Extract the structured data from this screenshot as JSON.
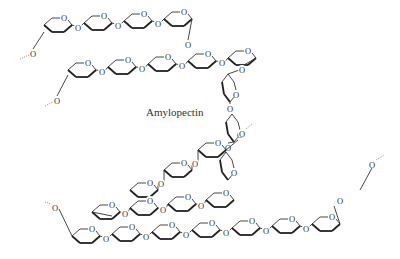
{
  "diagram": {
    "title": "Amylopectin",
    "label_position": {
      "x": 146,
      "y": 106
    },
    "atom_symbol": "O",
    "colors": {
      "background": "#ffffff",
      "bonds": "#333333",
      "text": "#333333"
    },
    "chains": [
      {
        "name": "top-chain",
        "rings": 4
      },
      {
        "name": "second-chain",
        "rings": 5
      },
      {
        "name": "right-descending-chain",
        "rings": 4
      },
      {
        "name": "middle-branch-chain",
        "rings": 3
      },
      {
        "name": "lower-left-chain",
        "rings": 4
      },
      {
        "name": "bottom-chain",
        "rings": 7
      }
    ]
  }
}
